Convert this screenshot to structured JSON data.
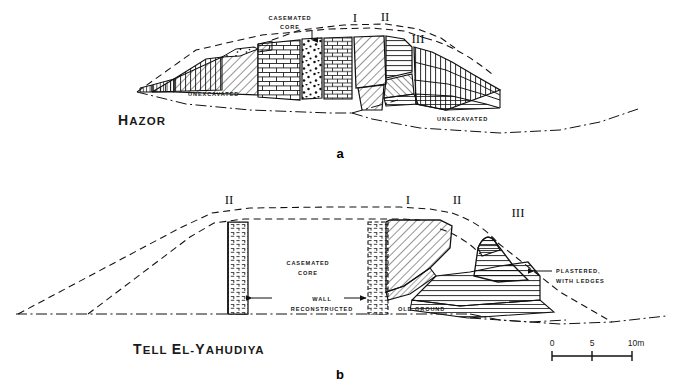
{
  "figure": {
    "type": "archaeological-cross-section",
    "panels": [
      {
        "id": "a",
        "letter": "a",
        "title": "Hazor",
        "labels": {
          "casemated_core": "CASEMATED\nCORE",
          "casemated_core_line1": "CASEMATED",
          "casemated_core_line2": "CORE",
          "unexcavated_left": "UNEXCAVATED",
          "unexcavated_right": "UNEXCAVATED"
        },
        "phases": [
          "I",
          "II",
          "III"
        ]
      },
      {
        "id": "b",
        "letter": "b",
        "title": "Tell el-Yahudiya",
        "labels": {
          "casemated_core_line1": "CASEMATED",
          "casemated_core_line2": "CORE",
          "wall_line1": "WALL",
          "wall_line2": "RECONSTRUCTED",
          "old_ground": "OLD GROUND",
          "plastered_line1": "PLASTERED,",
          "plastered_line2": "WITH LEDGES"
        },
        "phases": [
          "II",
          "I",
          "II",
          "III"
        ]
      }
    ],
    "scale_bar": {
      "ticks": [
        "0",
        "5",
        "10m"
      ],
      "start_label": "0",
      "mid_label": "5",
      "end_label": "10m"
    },
    "colors": {
      "ink": "#111111",
      "paper": "#ffffff",
      "label": "#1a1a1a"
    }
  }
}
